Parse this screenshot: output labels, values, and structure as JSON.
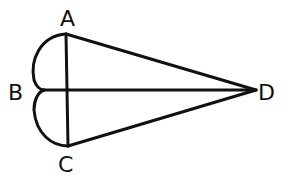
{
  "diagram": {
    "vertices": [
      {
        "id": "A",
        "label": "A",
        "x": 66,
        "y": 34,
        "lx": 68,
        "ly": 22
      },
      {
        "id": "B",
        "label": "B",
        "x": 40,
        "y": 90,
        "lx": 18,
        "ly": 98
      },
      {
        "id": "C",
        "label": "C",
        "x": 68,
        "y": 146,
        "lx": 68,
        "ly": 170
      },
      {
        "id": "D",
        "label": "D",
        "x": 256,
        "y": 90,
        "lx": 270,
        "ly": 98
      }
    ],
    "edges": [
      {
        "from": "A",
        "to": "B",
        "type": "arc"
      },
      {
        "from": "A",
        "to": "C",
        "type": "line"
      },
      {
        "from": "B",
        "to": "C",
        "type": "arc"
      },
      {
        "from": "A",
        "to": "D",
        "type": "line"
      },
      {
        "from": "B",
        "to": "D",
        "type": "line"
      },
      {
        "from": "C",
        "to": "D",
        "type": "line"
      }
    ],
    "stroke_color": "#111111"
  }
}
